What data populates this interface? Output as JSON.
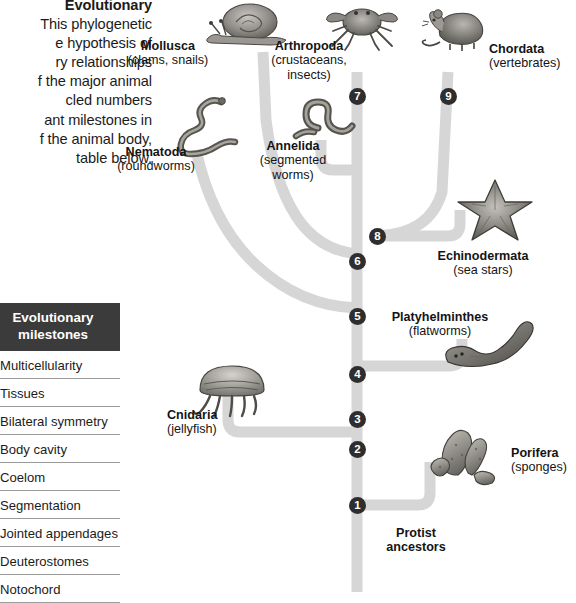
{
  "caption": {
    "title": "Evolutionary",
    "body": "This phylogenetic  e hypothesis of ry relationships  f the major animal cled numbers ant milestones in  f the animal body, table below.",
    "lines": [
      "Evolutionary",
      "This phylogenetic",
      "e hypothesis of",
      "ry relationships",
      "f the major animal",
      "cled numbers",
      "ant milestones in",
      "f the animal body,",
      "table below."
    ]
  },
  "milestones_table": {
    "header": "Evolutionary milestones",
    "header_line1": "Evolutionary",
    "header_line2": "milestones",
    "rows": [
      "Multicellularity",
      "Tissues",
      "Bilateral symmetry",
      "Body cavity",
      "Coelom",
      "Segmentation",
      "Jointed appendages",
      "Deuterostomes",
      "Notochord"
    ]
  },
  "tree": {
    "root_label_line1": "Protist",
    "root_label_line2": "ancestors",
    "branch_color": "#d6d6d6",
    "node_color": "#2e2e2e",
    "nodes": [
      {
        "id": "1",
        "label": "1",
        "milestone": "Multicellularity",
        "x": 357,
        "y": 505
      },
      {
        "id": "2",
        "label": "2",
        "milestone": "Tissues",
        "x": 357,
        "y": 449
      },
      {
        "id": "3",
        "label": "3",
        "milestone": "Bilateral symmetry",
        "x": 357,
        "y": 419
      },
      {
        "id": "4",
        "label": "4",
        "milestone": "Body cavity",
        "x": 357,
        "y": 374
      },
      {
        "id": "5",
        "label": "5",
        "milestone": "Coelom",
        "x": 357,
        "y": 316
      },
      {
        "id": "6",
        "label": "6",
        "milestone": "Segmentation",
        "x": 357,
        "y": 261
      },
      {
        "id": "7",
        "label": "7",
        "milestone": "Jointed appendages",
        "x": 357,
        "y": 96
      },
      {
        "id": "8",
        "label": "8",
        "milestone": "Deuterostomes",
        "x": 377,
        "y": 236
      },
      {
        "id": "9",
        "label": "9",
        "milestone": "Notochord",
        "x": 448,
        "y": 96
      }
    ],
    "taxa": [
      {
        "id": "mollusca",
        "name": "Mollusca",
        "common": "(clams, snails)",
        "icon": "snail-illustration"
      },
      {
        "id": "arthropoda",
        "name": "Arthropoda",
        "common": "(crustaceans, insects)",
        "common_line1": "(crustaceans,",
        "common_line2": "insects)",
        "icon": "crab-illustration"
      },
      {
        "id": "chordata",
        "name": "Chordata",
        "common": "(vertebrates)",
        "icon": "mouse-illustration"
      },
      {
        "id": "nematoda",
        "name": "Nematoda",
        "common": "(roundworms)",
        "icon": "roundworm-illustration"
      },
      {
        "id": "annelida",
        "name": "Annelida",
        "common": "(segmented worms)",
        "common_line1": "(segmented",
        "common_line2": "worms)",
        "icon": "segmented-worm-illustration"
      },
      {
        "id": "echinodermata",
        "name": "Echinodermata",
        "common": "(sea stars)",
        "icon": "sea-star-illustration"
      },
      {
        "id": "platyhelminthes",
        "name": "Platyhelminthes",
        "common": "(flatworms)",
        "icon": "flatworm-illustration"
      },
      {
        "id": "cnidaria",
        "name": "Cnidaria",
        "common": "(jellyfish)",
        "icon": "jellyfish-illustration"
      },
      {
        "id": "porifera",
        "name": "Porifera",
        "common": "(sponges)",
        "icon": "sponge-illustration"
      }
    ]
  }
}
